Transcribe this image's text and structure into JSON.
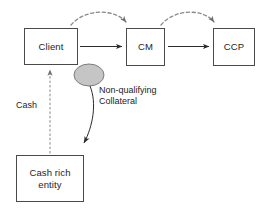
{
  "diagram": {
    "colors": {
      "box_border": "#4a4a4a",
      "box_fill": "#ffffff",
      "ellipse_fill": "#c5c5c5",
      "ellipse_stroke": "#7d7d7d",
      "solid_arrow": "#2b2b2b",
      "dashed_arrow": "#8a8a8a",
      "text": "#1d1d1d",
      "background": "#ffffff"
    },
    "nodes": [
      {
        "id": "client",
        "label": "Client",
        "shape": "rectangle"
      },
      {
        "id": "cm",
        "label": "CM",
        "shape": "rectangle"
      },
      {
        "id": "ccp",
        "label": "CCP",
        "shape": "rectangle"
      },
      {
        "id": "cash_rich_entity",
        "label": "Cash rich\nentity",
        "shape": "rectangle"
      },
      {
        "id": "transformer",
        "label": "",
        "shape": "ellipse"
      }
    ],
    "edges": [
      {
        "id": "client-to-cm",
        "from": "client",
        "to": "cm",
        "style": "solid",
        "label": ""
      },
      {
        "id": "cm-to-ccp",
        "from": "cm",
        "to": "ccp",
        "style": "solid",
        "label": ""
      },
      {
        "id": "client-to-cm-dashed",
        "from": "client",
        "to": "cm",
        "style": "dashed-arc",
        "label": ""
      },
      {
        "id": "cm-to-ccp-dashed",
        "from": "cm",
        "to": "ccp",
        "style": "dashed-arc",
        "label": ""
      },
      {
        "id": "cash-rich-to-client",
        "from": "cash_rich_entity",
        "to": "client",
        "style": "dotted",
        "label": "Cash"
      },
      {
        "id": "transformer-to-cash-rich",
        "from": "transformer",
        "to": "cash_rich_entity",
        "style": "curved",
        "label": "Non-qualifying\nCollateral"
      }
    ],
    "labels": {
      "cash": "Cash",
      "non_qualifying_collateral": "Non-qualifying\nCollateral"
    }
  }
}
